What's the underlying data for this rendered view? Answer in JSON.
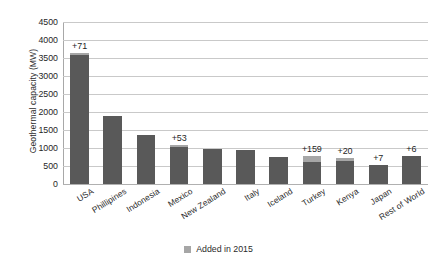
{
  "chart_data": {
    "type": "bar",
    "title": "",
    "xlabel": "",
    "ylabel": "Geothermal capacity (MW)",
    "ylim": [
      0,
      4500
    ],
    "ytick_step": 500,
    "yticks": [
      4500,
      4000,
      3500,
      3000,
      2500,
      2000,
      1500,
      1000,
      500,
      0
    ],
    "grid": true,
    "legend_position": "bottom-center",
    "categories": [
      "USA",
      "Phillipines",
      "Indonesia",
      "Mexico",
      "New Zealand",
      "Italy",
      "Iceland",
      "Turkey",
      "Kenya",
      "Japan",
      "Rest of World"
    ],
    "series": [
      {
        "name": "Existing capacity",
        "color": "#595959",
        "values": [
          3580,
          1900,
          1350,
          1020,
          980,
          940,
          750,
          620,
          640,
          520,
          780
        ]
      },
      {
        "name": "Added in 2015",
        "color": "#a6a6a6",
        "values": [
          71,
          0,
          0,
          53,
          0,
          0,
          0,
          159,
          20,
          7,
          6
        ]
      }
    ],
    "totals": [
      3651,
      1900,
      1350,
      1073,
      980,
      940,
      750,
      779,
      660,
      527,
      786
    ],
    "bar_labels": [
      "+71",
      "",
      "",
      "+53",
      "",
      "",
      "",
      "+159",
      "+20",
      "+7",
      "+6"
    ],
    "annotations": [
      {
        "category": "USA",
        "text": "+71"
      },
      {
        "category": "Mexico",
        "text": "+53"
      },
      {
        "category": "Turkey",
        "text": "+159"
      },
      {
        "category": "Kenya",
        "text": "+20"
      },
      {
        "category": "Japan",
        "text": "+7"
      },
      {
        "category": "Rest of World",
        "text": "+6"
      }
    ]
  },
  "legend": {
    "label": "Added in 2015",
    "swatch_color": "#a6a6a6"
  },
  "axis": {
    "y_title": "Geothermal capacity (MW)"
  },
  "colors": {
    "bar_base": "#595959",
    "bar_added": "#a6a6a6",
    "gridline": "#c9c9c9",
    "text": "#2b2b2b",
    "background": "#ffffff"
  }
}
